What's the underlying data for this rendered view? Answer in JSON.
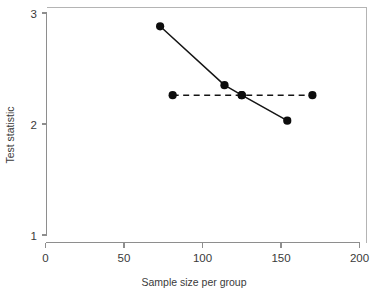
{
  "chart_data": {
    "type": "line",
    "title": "",
    "xlabel": "Sample size per group",
    "ylabel": "Test statistic",
    "xlim": [
      0,
      200
    ],
    "ylim": [
      1,
      3
    ],
    "grid": false,
    "legend": "none",
    "xticks": [
      0,
      50,
      100,
      150,
      200
    ],
    "xticklabels": [
      "0",
      "50",
      "100",
      "150",
      "200"
    ],
    "yticks": [
      1,
      2,
      3
    ],
    "yticklabels": [
      "1",
      "2",
      "3"
    ],
    "series": [
      {
        "name": "decreasing-test-statistic",
        "style": "solid",
        "marker": "filled-circle",
        "x": [
          73,
          114,
          125,
          154
        ],
        "y": [
          2.88,
          2.35,
          2.26,
          2.03
        ]
      },
      {
        "name": "constant-critical-value",
        "style": "dashed",
        "marker": "filled-circle",
        "x": [
          81,
          125,
          170
        ],
        "y": [
          2.26,
          2.26,
          2.26
        ]
      }
    ],
    "colors": {
      "series": "#0d0d0d",
      "axis": "#8e8e8e",
      "frame": "#b4b4b4",
      "text": "#3a3a3a",
      "background": "#ffffff"
    }
  },
  "axis_titles": {
    "x": "Sample size per group",
    "y": "Test statistic"
  }
}
